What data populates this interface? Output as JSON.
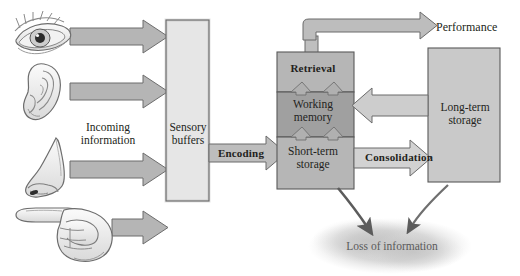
{
  "diagram": {
    "type": "flow-diagram",
    "background": "#ffffff"
  },
  "inputs": {
    "caption": "Incoming\ninformation",
    "senses": [
      {
        "name": "eye-icon",
        "label": "vision"
      },
      {
        "name": "ear-icon",
        "label": "hearing"
      },
      {
        "name": "nose-icon",
        "label": "smell"
      },
      {
        "name": "finger-icon",
        "label": "touch"
      }
    ]
  },
  "boxes": {
    "sensory_buffers": {
      "label": "Sensory\nbuffers",
      "fill": "#e3e3e3"
    },
    "retrieval": {
      "label": "Retrieval",
      "fill": "#b3b3b3"
    },
    "working_memory": {
      "label": "Working\nmemory",
      "fill": "#a0a0a0"
    },
    "short_term_storage": {
      "label": "Short-term\nstorage",
      "fill": "#b3b3b3"
    },
    "long_term_storage": {
      "label": "Long-term\nstorage",
      "fill": "#c6c6c6"
    }
  },
  "arrows": {
    "encoding": {
      "label": "Encoding",
      "fill": "#b9b9b9"
    },
    "consolidation": {
      "label": "Consolidation",
      "fill": "#cfcfcf"
    },
    "performance": {
      "label": "Performance",
      "fill": "#b5b5b5"
    },
    "retrieval_feedback": {
      "label": "",
      "fill": "#c2c2c2"
    }
  },
  "loss": {
    "label": "Loss of information",
    "cloud_fill": "#c9c9c9",
    "text_color": "#5a5a5a"
  },
  "colors": {
    "outline": "#4a4a4a",
    "text": "#231f20",
    "arrow_gray": "#b9b9b9",
    "curve_arrow": "#5c5c5c"
  }
}
